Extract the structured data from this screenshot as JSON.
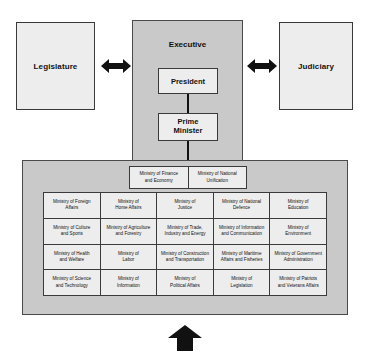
{
  "diagram": {
    "branches": {
      "legislature": "Legislature",
      "executive": "Executive",
      "judiciary": "Judiciary"
    },
    "executive_heads": {
      "president": "President",
      "prime_minister": "Prime\nMinister",
      "prime_minister_line1": "Prime",
      "prime_minister_line2": "Minister"
    },
    "icons": {
      "left_double_arrow": "double-arrow-horizontal-icon",
      "right_double_arrow": "double-arrow-horizontal-icon",
      "bottom_up_arrow": "arrow-up-icon"
    },
    "colors": {
      "panel_fill": "#c9c9c9",
      "box_fill": "#ededed",
      "border": "#3a3a3a",
      "arrow": "#111111",
      "text": "#111111"
    }
  },
  "top_ministries": [
    {
      "line1": "Ministry of Finance",
      "line2": "and Economy"
    },
    {
      "line1": "Ministry of National",
      "line2": "Unification"
    }
  ],
  "ministry_grid": {
    "rows": 4,
    "columns": 5,
    "cells": [
      {
        "line1": "Ministry of Foreign",
        "line2": "Affairs"
      },
      {
        "line1": "Ministry of",
        "line2": "Home Affairs"
      },
      {
        "line1": "Ministry of",
        "line2": "Justice"
      },
      {
        "line1": "Ministry of National",
        "line2": "Defence"
      },
      {
        "line1": "Ministry of",
        "line2": "Education"
      },
      {
        "line1": "Ministry of Culture",
        "line2": "and Sports"
      },
      {
        "line1": "Ministry of Agriculture",
        "line2": "and Forestry"
      },
      {
        "line1": "Ministry of Trade,",
        "line2": "Industry and Energy"
      },
      {
        "line1": "Ministry of Information",
        "line2": "and Communication"
      },
      {
        "line1": "Ministry of",
        "line2": "Environment"
      },
      {
        "line1": "Ministry of Health",
        "line2": "and Welfare"
      },
      {
        "line1": "Ministry of",
        "line2": "Labor"
      },
      {
        "line1": "Ministry of Construction",
        "line2": "and Transportation"
      },
      {
        "line1": "Ministry of Maritime",
        "line2": "Affairs and Fisheries"
      },
      {
        "line1": "Ministry of Government",
        "line2": "Administration"
      },
      {
        "line1": "Ministry of Science",
        "line2": "and Technology"
      },
      {
        "line1": "Ministry of",
        "line2": "Information"
      },
      {
        "line1": "Ministry of",
        "line2": "Political Affairs"
      },
      {
        "line1": "Ministry of",
        "line2": "Legislation"
      },
      {
        "line1": "Ministry of Patriots",
        "line2": "and Veterans Affairs"
      }
    ]
  }
}
